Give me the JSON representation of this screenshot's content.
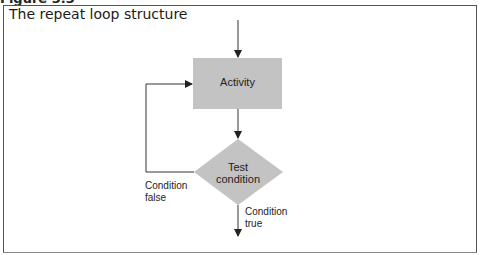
{
  "figure": {
    "label": "Figure 3.3",
    "title": "The repeat loop structure"
  },
  "diagram": {
    "nodes": [
      {
        "id": "activity",
        "shape": "rectangle",
        "label": "Activity",
        "fill": "#c3c3c3"
      },
      {
        "id": "test",
        "shape": "diamond",
        "label_line1": "Test",
        "label_line2": "condition",
        "fill": "#c3c3c3"
      }
    ],
    "edges": [
      {
        "from": "entry",
        "to": "activity"
      },
      {
        "from": "activity",
        "to": "test"
      },
      {
        "from": "test",
        "to": "activity",
        "label_line1": "Condition",
        "label_line2": "false"
      },
      {
        "from": "test",
        "to": "exit",
        "label_line1": "Condition",
        "label_line2": "true"
      }
    ],
    "colors": {
      "node_fill": "#c3c3c3",
      "line": "#333333",
      "frame": "#555555"
    }
  }
}
